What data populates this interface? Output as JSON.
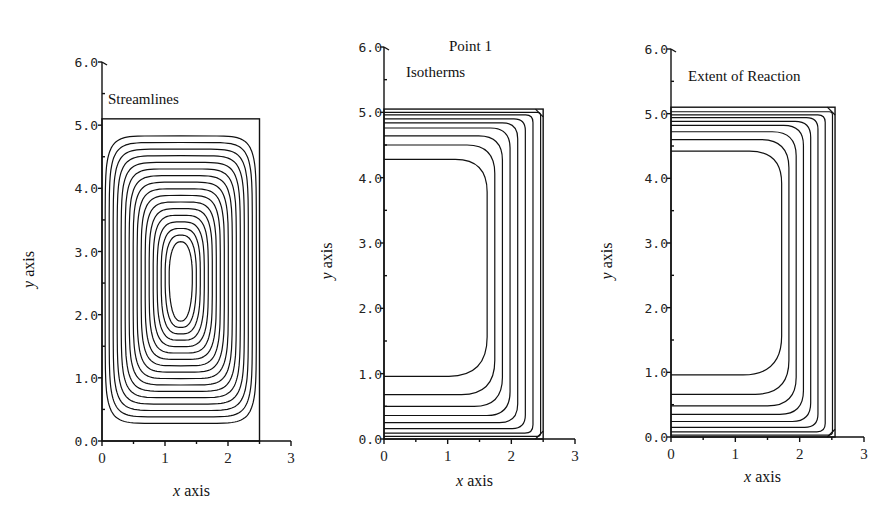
{
  "figure_title": "Point 1",
  "chart_data": [
    {
      "type": "contour",
      "title": "Streamlines",
      "xlabel": "x axis",
      "ylabel": "y axis",
      "xlim": [
        0,
        3
      ],
      "ylim": [
        0,
        6.0
      ],
      "xticks": [
        "0",
        "1",
        "2",
        "3"
      ],
      "yticks": [
        "0.0",
        "1.0",
        "2.0",
        "3.0",
        "4.0",
        "5.0",
        "6.0"
      ],
      "domain": {
        "width": 2.5,
        "height": 5.1
      },
      "contours": "closed nested loops centered near (1.25, 2.6)",
      "n_contours": 17
    },
    {
      "type": "contour",
      "title": "Isotherms",
      "xlabel": "x axis",
      "ylabel": "y axis",
      "xlim": [
        0,
        3
      ],
      "ylim": [
        0,
        6.0
      ],
      "xticks": [
        "0",
        "1",
        "2",
        "3"
      ],
      "yticks": [
        "0.0",
        "1.0",
        "2.0",
        "3.0",
        "4.0",
        "5.0",
        "6.0"
      ],
      "domain": {
        "width": 2.5,
        "height": 5.05
      },
      "contours": "nested C-shaped curves concentrated toward top, bottom and right walls",
      "bottom_levels_y": [
        0.96,
        0.68,
        0.5,
        0.36,
        0.25,
        0.16,
        0.09,
        0.04
      ],
      "top_levels_y": [
        4.28,
        4.5,
        4.64,
        4.76,
        4.84,
        4.9,
        4.96,
        5.0
      ]
    },
    {
      "type": "contour",
      "title": "Extent of Reaction",
      "xlabel": "x axis",
      "ylabel": "y axis",
      "xlim": [
        0,
        3
      ],
      "ylim": [
        0,
        6.0
      ],
      "xticks": [
        "0",
        "1",
        "2",
        "3"
      ],
      "yticks": [
        "0.0",
        "1.0",
        "2.0",
        "3.0",
        "4.0",
        "5.0",
        "6.0"
      ],
      "domain": {
        "width": 2.55,
        "height": 5.1
      },
      "contours": "nested C-shaped curves concentrated toward top, bottom and right walls",
      "bottom_levels_y": [
        0.96,
        0.66,
        0.48,
        0.35,
        0.24,
        0.15,
        0.08,
        0.03
      ],
      "top_levels_y": [
        4.42,
        4.6,
        4.72,
        4.82,
        4.88,
        4.94,
        4.98,
        5.03
      ]
    }
  ]
}
